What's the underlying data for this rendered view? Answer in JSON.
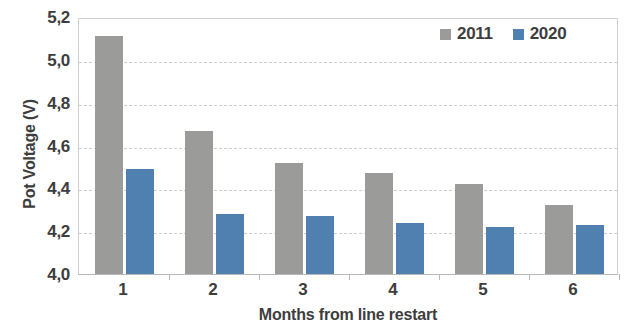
{
  "chart_data": {
    "type": "bar",
    "title": "",
    "xlabel": "Months from line restart",
    "ylabel": "Pot Voltage (V)",
    "categories": [
      "1",
      "2",
      "3",
      "4",
      "5",
      "6"
    ],
    "ylim": [
      4.0,
      5.2
    ],
    "ytick_labels": [
      "5,2",
      "5,0",
      "4,8",
      "4,6",
      "4,4",
      "4,2",
      "4,0"
    ],
    "ytick_values": [
      5.2,
      5.0,
      4.8,
      4.6,
      4.4,
      4.2,
      4.0
    ],
    "grid": true,
    "legend_position": "top-right",
    "decimal_separator": ",",
    "series": [
      {
        "name": "2011",
        "color": "#9b9b99",
        "values": [
          5.11,
          4.67,
          4.52,
          4.47,
          4.42,
          4.32
        ]
      },
      {
        "name": "2020",
        "color": "#5080b0",
        "values": [
          4.49,
          4.28,
          4.27,
          4.24,
          4.22,
          4.23
        ]
      }
    ]
  },
  "legend": {
    "items": [
      {
        "label": "2011",
        "color": "#9b9b99"
      },
      {
        "label": "2020",
        "color": "#5080b0"
      }
    ]
  },
  "axes": {
    "y_title": "Pot Voltage (V)",
    "x_title": "Months from line restart"
  }
}
